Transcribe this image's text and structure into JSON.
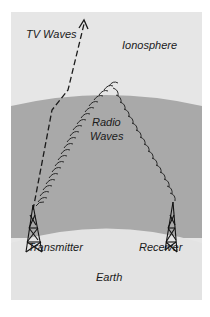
{
  "labels": {
    "tv_waves": "TV Waves",
    "ionosphere": "Ionosphere",
    "radio_line1": "Radio",
    "radio_line2": "Waves",
    "transmitter": "Transmitter",
    "receiver": "Receiver",
    "earth": "Earth"
  },
  "colors": {
    "sky": "#e6e6e6",
    "ionosphere_band": "#a9a9a9",
    "earth": "#e3e3e3",
    "ink": "#1a1a1a"
  }
}
